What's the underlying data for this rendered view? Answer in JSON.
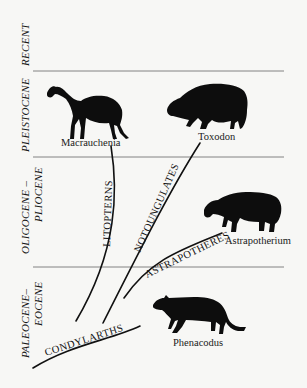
{
  "figure": {
    "epochs": [
      {
        "id": "recent",
        "label": "RECENT"
      },
      {
        "id": "pleistocene",
        "label": "PLEISTOCENE"
      },
      {
        "id": "oligocene-pliocene",
        "label_line1": "OLIGOCENE –",
        "label_line2": "PLIOCENE"
      },
      {
        "id": "paleocene-eocene",
        "label_line1": "PALEOCENE–",
        "label_line2": "EOCENE"
      }
    ],
    "lineages": [
      {
        "id": "litopterns",
        "label": "LITOPTERNS"
      },
      {
        "id": "notoungulates",
        "label": "NOTOUNGULATES"
      },
      {
        "id": "astrapotheres",
        "label": "ASTRAPOTHERES"
      },
      {
        "id": "condylarths",
        "label": "CONDYLARTHS"
      }
    ],
    "taxa": [
      {
        "id": "macrauchenia",
        "label": "Macrauchenia",
        "epoch": "Pleistocene",
        "lineage": "Litopterns"
      },
      {
        "id": "toxodon",
        "label": "Toxodon",
        "epoch": "Pleistocene",
        "lineage": "Notoungulates"
      },
      {
        "id": "astrapotherium",
        "label": "Astrapotherium",
        "epoch": "Oligocene–Pliocene",
        "lineage": "Astrapotheres"
      },
      {
        "id": "phenacodus",
        "label": "Phenacodus",
        "epoch": "Paleocene–Eocene",
        "lineage": "Condylarths"
      }
    ],
    "colors": {
      "background": "#f7f7f5",
      "ink": "#111111",
      "rule": "#666666"
    }
  }
}
